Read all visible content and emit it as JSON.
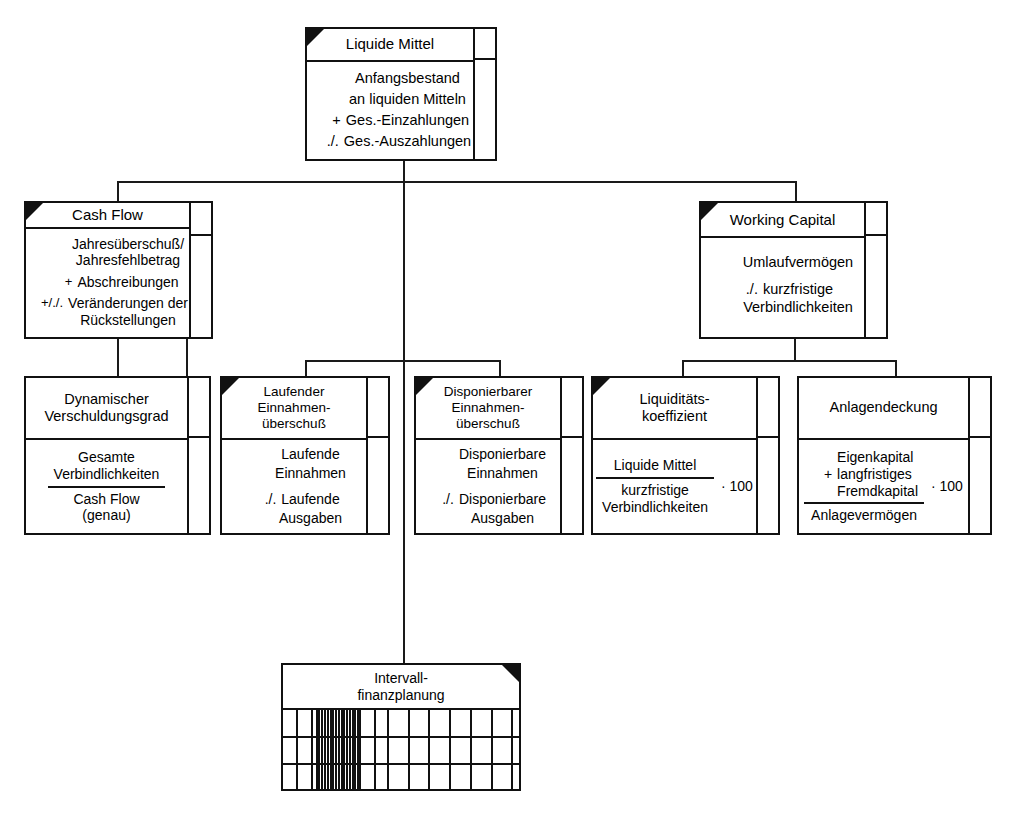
{
  "diagram": {
    "line_color": "#111111",
    "background": "#ffffff"
  },
  "nodes": {
    "root": {
      "id": "liquide-mittel",
      "header": "Liquide Mittel",
      "marker": "top-left-triangle",
      "lines": [
        {
          "op": "",
          "text": "Anfangsbestand"
        },
        {
          "op": "",
          "text": "an liquiden Mitteln"
        },
        {
          "op": "+",
          "text": "Ges.-Einzahlungen"
        },
        {
          "op": "./.",
          "text": "Ges.-Auszahlungen"
        }
      ]
    },
    "cash_flow": {
      "id": "cash-flow",
      "header": "Cash Flow",
      "marker": "top-left-triangle",
      "lines": [
        {
          "op": "",
          "text": "Jahresüberschuß/"
        },
        {
          "op": "",
          "text": "Jahresfehlbetrag"
        },
        {
          "op": "+",
          "text": "Abschreibungen"
        },
        {
          "op": "+/./.",
          "text": "Veränderungen der"
        },
        {
          "op": "",
          "text": "Rückstellungen",
          "indent": true
        }
      ]
    },
    "working_capital": {
      "id": "working-capital",
      "header": "Working Capital",
      "marker": "top-left-triangle",
      "lines": [
        {
          "op": "",
          "text": "Umlaufvermögen"
        },
        {
          "op": "./.",
          "text": "kurzfristige"
        },
        {
          "op": "",
          "text": "Verbindlichkeiten",
          "indent": true
        }
      ]
    },
    "dyn_verschuldungsgrad": {
      "id": "dynamischer-verschuldungsgrad",
      "header": [
        "Dynamischer",
        "Verschuldungsgrad"
      ],
      "marker": "none",
      "fraction": {
        "numerator": [
          "Gesamte",
          "Verbindlichkeiten"
        ],
        "denominator": [
          "Cash Flow",
          "(genau)"
        ],
        "multiplier": ""
      }
    },
    "laufender_einnahmenueberschuss": {
      "id": "laufender-einnahmenueberschuss",
      "header": [
        "Laufender",
        "Einnahmen-",
        "überschuß"
      ],
      "marker": "top-left-triangle",
      "lines": [
        {
          "op": "",
          "text": "Laufende"
        },
        {
          "op": "",
          "text": "Einnahmen"
        },
        {
          "op": "./.",
          "text": "Laufende"
        },
        {
          "op": "",
          "text": "Ausgaben",
          "indent": true
        }
      ]
    },
    "disponierbarer_einnahmenueberschuss": {
      "id": "disponierbarer-einnahmenueberschuss",
      "header": [
        "Disponierbarer",
        "Einnahmen-",
        "überschuß"
      ],
      "marker": "top-left-triangle",
      "lines": [
        {
          "op": "",
          "text": "Disponierbare"
        },
        {
          "op": "",
          "text": "Einnahmen"
        },
        {
          "op": "./.",
          "text": "Disponierbare"
        },
        {
          "op": "",
          "text": "Ausgaben",
          "indent": true
        }
      ]
    },
    "liquiditaetskoeffizient": {
      "id": "liquiditaetskoeffizient",
      "header": [
        "Liquiditäts-",
        "koeffizient"
      ],
      "marker": "top-left-triangle",
      "fraction": {
        "numerator": [
          "Liquide Mittel"
        ],
        "denominator": [
          "kurzfristige",
          "Verbindlichkeiten"
        ],
        "multiplier": "· 100"
      }
    },
    "anlagendeckung": {
      "id": "anlagendeckung",
      "header": [
        "Anlagendeckung"
      ],
      "marker": "none",
      "fraction": {
        "numerator_rows": [
          {
            "op": "",
            "text": "Eigenkapital"
          },
          {
            "op": "+",
            "text": "langfristiges"
          },
          {
            "op": "",
            "text": "Fremdkapital",
            "indent": true
          }
        ],
        "denominator": [
          "Anlagevermögen"
        ],
        "multiplier": "· 100"
      }
    },
    "intervallfinanzplanung": {
      "id": "intervallfinanzplanung",
      "header": [
        "Intervall-",
        "finanzplanung"
      ],
      "marker": "top-right-triangle",
      "grid": {
        "rows": 3,
        "sparse_columns": [
          38,
          80,
          220,
          262
        ],
        "dense_columns": [
          94,
          102,
          110,
          118,
          126,
          134,
          142,
          150,
          158,
          166,
          174,
          182,
          190,
          198,
          206,
          214
        ],
        "extra_columns": [
          300,
          360,
          418,
          478,
          538,
          598,
          656
        ]
      }
    }
  },
  "connections": [
    {
      "from": "liquide-mittel",
      "to": "cash-flow"
    },
    {
      "from": "liquide-mittel",
      "to": "working-capital"
    },
    {
      "from": "liquide-mittel",
      "to": "intervallfinanzplanung"
    },
    {
      "from": "cash-flow",
      "to": "dynamischer-verschuldungsgrad"
    },
    {
      "from": "cash-flow",
      "to": "laufender-einnahmenueberschuss"
    },
    {
      "from": "cash-flow",
      "to": "disponierbarer-einnahmenueberschuss"
    },
    {
      "from": "working-capital",
      "to": "liquiditaetskoeffizient"
    },
    {
      "from": "working-capital",
      "to": "anlagendeckung"
    }
  ]
}
